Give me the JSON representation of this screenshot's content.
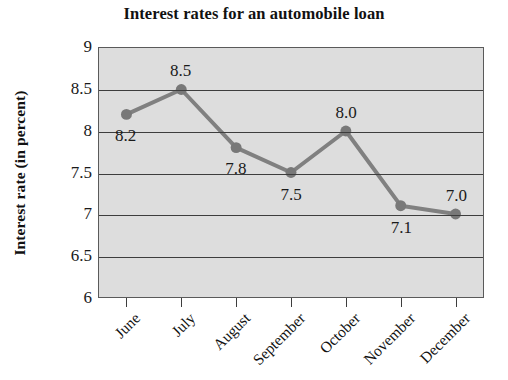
{
  "chart_data": {
    "type": "line",
    "title": "Interest rates for an automobile loan",
    "xlabel": "",
    "ylabel": "Interest rate (in percent)",
    "categories": [
      "June",
      "July",
      "August",
      "September",
      "October",
      "November",
      "December"
    ],
    "values": [
      8.2,
      8.5,
      7.8,
      7.5,
      8.0,
      7.1,
      7.0
    ],
    "point_labels": [
      "8.2",
      "8.5",
      "7.8",
      "7.5",
      "8.0",
      "7.1",
      "7.0"
    ],
    "ylim": [
      6,
      9
    ],
    "yticks": [
      9,
      8.5,
      8,
      7.5,
      7,
      6.5,
      6
    ],
    "ytick_labels": [
      "9",
      "8.5",
      "8",
      "7.5",
      "7",
      "6.5",
      "6"
    ],
    "grid": true,
    "legend": "none",
    "series_color": "#808080",
    "marker_color": "#787878",
    "plot_background": "#dddddd",
    "gridline_color": "#3d3d3d",
    "axis_color": "#5a5a5a",
    "figure_background": "#ffffff",
    "label_positions": [
      "below",
      "above",
      "below",
      "below",
      "above",
      "below",
      "above"
    ]
  }
}
